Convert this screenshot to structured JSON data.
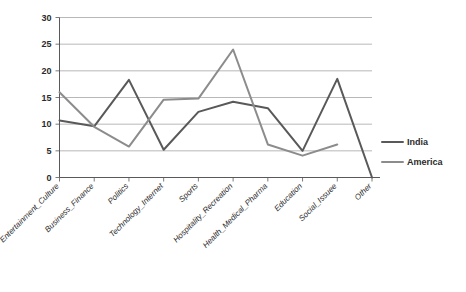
{
  "chart_data": {
    "type": "line",
    "title": "",
    "xlabel": "",
    "ylabel": "",
    "ylim": [
      0,
      30
    ],
    "ytick_step": 5,
    "yticks": [
      "0",
      "5",
      "10",
      "15",
      "20",
      "25",
      "30"
    ],
    "grid": true,
    "legend_position": "right",
    "categories": [
      "Entertainment_Culture",
      "Business_Finance",
      "Politics",
      "Technology_Internet",
      "Sports",
      "Hospitality_Recreation",
      "Health_Medical_Pharma",
      "Education",
      "Social_Issuee",
      "Other"
    ],
    "series": [
      {
        "name": "India",
        "color": "#595959",
        "values": [
          10.7,
          9.6,
          18.3,
          5.2,
          12.3,
          14.2,
          13.0,
          5.0,
          18.5,
          0
        ]
      },
      {
        "name": "America",
        "color": "#8c8c8c",
        "values": [
          16.0,
          9.5,
          5.8,
          14.6,
          14.8,
          24.0,
          6.2,
          4.1,
          6.2,
          null
        ]
      }
    ]
  },
  "legend": {
    "items": [
      {
        "label": "India",
        "color": "#595959"
      },
      {
        "label": "America",
        "color": "#8c8c8c"
      }
    ]
  }
}
